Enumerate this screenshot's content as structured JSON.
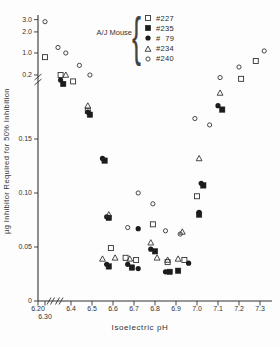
{
  "colors": {
    "ink": "#333333",
    "fill_ink": "#1c1c1c",
    "background": "#fdfdfd"
  },
  "legend": {
    "group_label": "A/J Mouse",
    "brace": "{",
    "entries": [
      {
        "marker": "open-square",
        "label": "#227"
      },
      {
        "marker": "filled-square",
        "label": "#235"
      },
      {
        "marker": "filled-circle",
        "label": "#  79"
      },
      {
        "marker": "open-triangle",
        "label": "#234"
      },
      {
        "marker": "open-circle",
        "label": "#240"
      }
    ]
  },
  "chart_data": {
    "type": "scatter",
    "title": "",
    "xlabel": "Isoelectric pH",
    "ylabel": "µg Inhibitor Required for 50% Inhibition",
    "legend_position": "top-center",
    "grid": false,
    "axis_breaks": {
      "x": "axis break between 6.30 and 6.4",
      "y": "axis break between 0.2 and 1.0 (upper section compressed log-like: 1.0, 2.0, 3.0)"
    },
    "x_ticks": [
      {
        "v": 6.2,
        "label": "6.20",
        "row": 1
      },
      {
        "v": 6.3,
        "label": "6.30",
        "row": 2
      },
      {
        "v": 6.4,
        "label": "6.4",
        "row": 1
      },
      {
        "v": 6.5,
        "label": "6.5",
        "row": 1
      },
      {
        "v": 6.6,
        "label": "6.6",
        "row": 1
      },
      {
        "v": 6.7,
        "label": "6.7",
        "row": 1
      },
      {
        "v": 6.8,
        "label": "6.8",
        "row": 1
      },
      {
        "v": 6.9,
        "label": "6.9",
        "row": 1
      },
      {
        "v": 7.0,
        "label": "7.0",
        "row": 1
      },
      {
        "v": 7.1,
        "label": "7.1",
        "row": 1
      },
      {
        "v": 7.2,
        "label": "7.2",
        "row": 1
      },
      {
        "v": 7.3,
        "label": "7.3",
        "row": 1
      }
    ],
    "y_ticks": [
      {
        "v": 0,
        "label": "0"
      },
      {
        "v": 0.05,
        "label": "0.05"
      },
      {
        "v": 0.1,
        "label": "0.10"
      },
      {
        "v": 0.15,
        "label": "0.15"
      },
      {
        "v": 0.2,
        "label": "0.2"
      },
      {
        "v": 1.0,
        "label": "1.0"
      },
      {
        "v": 2.0,
        "label": "2.0"
      },
      {
        "v": 3.0,
        "label": "3.0"
      }
    ],
    "series": [
      {
        "name": "#227",
        "marker": "open-square",
        "points": [
          [
            6.3,
            0.85
          ],
          [
            6.36,
            0.2
          ],
          [
            6.41,
            0.195
          ],
          [
            6.48,
            0.172
          ],
          [
            6.59,
            0.049
          ],
          [
            6.66,
            0.04
          ],
          [
            6.71,
            0.038
          ],
          [
            6.79,
            0.071
          ],
          [
            6.86,
            0.036
          ],
          [
            6.94,
            0.038
          ],
          [
            7.0,
            0.097
          ],
          [
            7.21,
            0.197
          ],
          [
            7.28,
            0.71
          ]
        ]
      },
      {
        "name": "#235",
        "marker": "filled-square",
        "points": [
          [
            6.37,
            0.193
          ],
          [
            6.49,
            0.169
          ],
          [
            6.56,
            0.13
          ],
          [
            6.58,
            0.077
          ],
          [
            6.58,
            0.032
          ],
          [
            6.69,
            0.031
          ],
          [
            6.8,
            0.046
          ],
          [
            6.87,
            0.027
          ],
          [
            6.91,
            0.028
          ],
          [
            7.01,
            0.08
          ],
          [
            7.03,
            0.107
          ],
          [
            7.12,
            0.173
          ]
        ]
      },
      {
        "name": "# 79",
        "marker": "filled-circle",
        "points": [
          [
            6.36,
            0.196
          ],
          [
            6.48,
            0.171
          ],
          [
            6.55,
            0.132
          ],
          [
            6.57,
            0.078
          ],
          [
            6.57,
            0.034
          ],
          [
            6.67,
            0.034
          ],
          [
            6.72,
            0.067
          ],
          [
            6.72,
            0.03
          ],
          [
            6.78,
            0.048
          ],
          [
            6.85,
            0.027
          ],
          [
            6.96,
            0.035
          ],
          [
            7.01,
            0.082
          ],
          [
            7.02,
            0.109
          ],
          [
            7.1,
            0.176
          ]
        ]
      },
      {
        "name": "#234",
        "marker": "open-triangle",
        "points": [
          [
            6.38,
            0.2
          ],
          [
            6.48,
            0.176
          ],
          [
            6.55,
            0.039
          ],
          [
            6.58,
            0.08
          ],
          [
            6.61,
            0.04
          ],
          [
            6.68,
            0.039
          ],
          [
            6.78,
            0.054
          ],
          [
            6.81,
            0.04
          ],
          [
            6.86,
            0.038
          ],
          [
            6.91,
            0.039
          ],
          [
            6.93,
            0.064
          ],
          [
            7.01,
            0.132
          ],
          [
            7.11,
            0.186
          ]
        ]
      },
      {
        "name": "#240",
        "marker": "open-circle",
        "points": [
          [
            6.3,
            2.8
          ],
          [
            6.35,
            1.2
          ],
          [
            6.38,
            1.0
          ],
          [
            6.44,
            0.55
          ],
          [
            6.49,
            0.2
          ],
          [
            6.67,
            0.068
          ],
          [
            6.72,
            0.1
          ],
          [
            6.79,
            0.09
          ],
          [
            6.85,
            0.065
          ],
          [
            6.92,
            0.062
          ],
          [
            6.99,
            0.166
          ],
          [
            7.06,
            0.161
          ],
          [
            7.11,
            0.198
          ],
          [
            7.2,
            0.49
          ],
          [
            7.32,
            1.07
          ]
        ]
      }
    ]
  }
}
